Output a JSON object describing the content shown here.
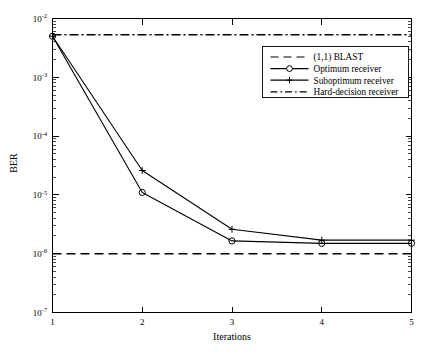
{
  "chart_data": {
    "type": "line",
    "title": "",
    "xlabel": "Iterations",
    "ylabel": "BER",
    "x": [
      1,
      2,
      3,
      4,
      5
    ],
    "xlim": [
      1,
      5
    ],
    "ylim": [
      1e-07,
      0.01
    ],
    "yscale": "log",
    "grid": false,
    "legend_position": "upper right",
    "xtick_labels": [
      "1",
      "2",
      "3",
      "4",
      "5"
    ],
    "ytick_labels": [
      "10-7",
      "10-6",
      "10-5",
      "10-4",
      "10-3",
      "10-2"
    ],
    "ytick_mantissa": "10",
    "ytick_exponents": [
      "-7",
      "-6",
      "-5",
      "-4",
      "-3",
      "-2"
    ],
    "series": [
      {
        "name": "Optimum receiver",
        "marker": "circle",
        "linestyle": "solid",
        "values": [
          0.005,
          1.1e-05,
          1.65e-06,
          1.5e-06,
          1.5e-06
        ]
      },
      {
        "name": "Suboptimum receiver",
        "marker": "plus",
        "linestyle": "solid",
        "values": [
          0.005,
          2.6e-05,
          2.6e-06,
          1.7e-06,
          1.7e-06
        ]
      }
    ],
    "reference_lines": [
      {
        "name": "(1,1) BLAST",
        "linestyle": "dashed",
        "value": 1e-06
      },
      {
        "name": "Hard-decision receiver",
        "linestyle": "dashdot",
        "value": 0.0053
      }
    ],
    "legend_entries": [
      {
        "label": "(1,1) BLAST",
        "style": "dashed",
        "marker": "none"
      },
      {
        "label": "Optimum receiver",
        "style": "solid",
        "marker": "circle"
      },
      {
        "label": "Suboptimum receiver",
        "style": "solid",
        "marker": "plus"
      },
      {
        "label": "Hard-decision receiver",
        "style": "dashdot",
        "marker": "none"
      }
    ]
  },
  "axes": {
    "y_title": "BER",
    "x_title": "Iterations"
  }
}
